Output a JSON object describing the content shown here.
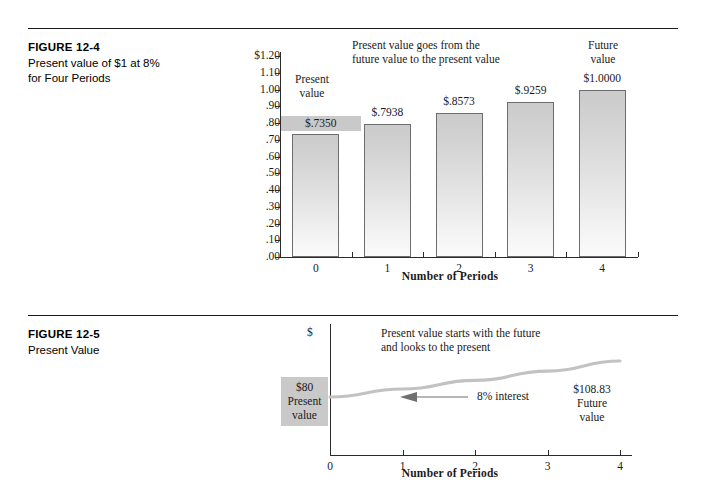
{
  "figures": [
    {
      "number": "FIGURE 12-4",
      "title": "Present value of $1 at 8% for Four Periods",
      "title_line1": "Present value of $1 at 8%",
      "title_line2": "for Four Periods"
    },
    {
      "number": "FIGURE 12-5",
      "title": "Present Value",
      "title_line1": "Present Value",
      "title_line2": ""
    }
  ],
  "chart_data": [
    {
      "type": "bar",
      "title": "Present value of $1 at 8% for Four Periods",
      "xlabel": "Number of Periods",
      "ylabel": "",
      "categories": [
        "0",
        "1",
        "2",
        "3",
        "4"
      ],
      "values": [
        0.735,
        0.7938,
        0.8573,
        0.9259,
        1.0
      ],
      "data_labels": [
        "$.7350",
        "$.7938",
        "$.8573",
        "$.9259",
        "$1.0000"
      ],
      "ylim": [
        0.0,
        1.2
      ],
      "ytick_labels": [
        "$1.20",
        "1.10",
        "1.00",
        ".90",
        ".80",
        ".70",
        ".60",
        ".50",
        ".40",
        ".30",
        ".20",
        ".10",
        ".00"
      ],
      "ytick_values": [
        1.2,
        1.1,
        1.0,
        0.9,
        0.8,
        0.7,
        0.6,
        0.5,
        0.4,
        0.3,
        0.2,
        0.1,
        0.0
      ],
      "grid": false,
      "legend": "none",
      "annotations": {
        "top_note_line1": "Present value goes from the",
        "top_note_line2": "future value to the present value",
        "left_label_line1": "Present",
        "left_label_line2": "value",
        "right_label_line1": "Future",
        "right_label_line2": "value"
      },
      "highlighted_label_index": 0,
      "bar_fill_top": "#cbcbcb",
      "bar_fill_bottom": "#fbfbfb",
      "bar_border": "#6d6d6d",
      "highlight_color": "#c9c9c9"
    },
    {
      "type": "line",
      "title": "Present Value",
      "xlabel": "Number of Periods",
      "ylabel": "$",
      "categories": [
        "0",
        "1",
        "2",
        "3",
        "4"
      ],
      "x": [
        0,
        1,
        2,
        3,
        4
      ],
      "values": [
        80.0,
        86.4,
        93.31,
        100.78,
        108.83
      ],
      "xlim": [
        0,
        4
      ],
      "grid": false,
      "legend": "none",
      "curve_color": "#c2c2c2",
      "annotations": {
        "top_note_line1": "Present value starts with the future",
        "top_note_line2": "and looks to the present",
        "present_value_amount": "$80",
        "present_value_line1": "Present",
        "present_value_line2": "value",
        "future_value_amount": "$108.83",
        "future_value_line1": "Future",
        "future_value_line2": "value",
        "interest_label": "8% interest",
        "arrow_direction": "left"
      },
      "highlight_color": "#c9c9c9"
    }
  ]
}
